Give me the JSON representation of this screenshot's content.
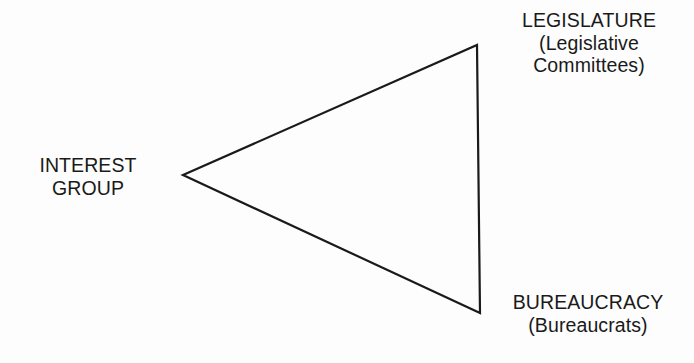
{
  "diagram": {
    "background_color": "#fdfdfd",
    "line_color": "#1a1a1a",
    "text_color": "#1a1a1a",
    "shape": "triangle",
    "vertices": {
      "left": {
        "x": 183,
        "y": 175
      },
      "top_right": {
        "x": 477,
        "y": 45
      },
      "bottom_right": {
        "x": 480,
        "y": 313
      }
    },
    "nodes": {
      "legislature": {
        "line1": "LEGISLATURE",
        "line2": "(Legislative",
        "line3": "Committees)"
      },
      "bureaucracy": {
        "line1": "BUREAUCRACY",
        "line2": "(Bureaucrats)"
      },
      "interest_group": {
        "line1": "INTEREST",
        "line2": "GROUP"
      }
    }
  }
}
